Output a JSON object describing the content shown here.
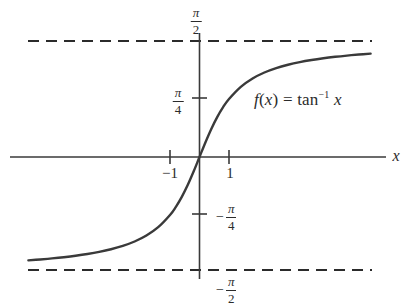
{
  "figure": {
    "title": "",
    "background_color": "#ffffff",
    "curve_color": "#3a3a3a",
    "axis_color": "#3a3a3a",
    "text_color": "#2b2b2b"
  },
  "annotations": {
    "formula_f": "f",
    "formula_open": "(",
    "formula_var": "x",
    "formula_close": ")",
    "formula_equals": "=",
    "formula_tan": "tan",
    "formula_exponent": "−1",
    "formula_arg": "x",
    "formula_plain": "f(x) = tan^-1 x"
  },
  "axes": {
    "x_axis_label": "x",
    "y_axis_label": "",
    "x_ticks": [
      {
        "value": -1,
        "label": "−1"
      },
      {
        "value": 1,
        "label": "1"
      }
    ],
    "y_ticks": [
      {
        "value": 0.7853981634,
        "label": "π/4",
        "numerator": "π",
        "denominator": "4",
        "sign": ""
      },
      {
        "value": -0.7853981634,
        "label": "−π/4",
        "numerator": "π",
        "denominator": "4",
        "sign": "−"
      }
    ],
    "asymptote_labels": [
      {
        "value": 1.5707963268,
        "label": "π/2",
        "numerator": "π",
        "denominator": "2",
        "sign": ""
      },
      {
        "value": -1.5707963268,
        "label": "−π/2",
        "numerator": "π",
        "denominator": "2",
        "sign": "−"
      }
    ]
  },
  "chart_data": {
    "type": "line",
    "title": "",
    "subtitle": "",
    "xlabel": "x",
    "ylabel": "",
    "grid": false,
    "legend": null,
    "xlim": [
      -5.8,
      5.8
    ],
    "ylim": [
      -1.75,
      1.75
    ],
    "x_tick_values": [
      -1,
      1
    ],
    "x_tick_labels": [
      "−1",
      "1"
    ],
    "y_tick_values": [
      0.7853981634,
      -0.7853981634
    ],
    "y_tick_labels": [
      "π/4",
      "−π/4"
    ],
    "series": [
      {
        "name": "f(x) = tan^-1 x",
        "function": "arctan",
        "color": "#3a3a3a",
        "linewidth": 2.4,
        "x": [
          -5.8,
          -5.4,
          -5.0,
          -4.6,
          -4.2,
          -3.8,
          -3.4,
          -3.0,
          -2.6,
          -2.2,
          -1.8,
          -1.4,
          -1.0,
          -0.8,
          -0.6,
          -0.4,
          -0.2,
          0.0,
          0.2,
          0.4,
          0.6,
          0.8,
          1.0,
          1.4,
          1.8,
          2.2,
          2.6,
          3.0,
          3.4,
          3.8,
          4.2,
          4.6,
          5.0,
          5.4,
          5.8
        ],
        "y": [
          -1.3998,
          -1.3876,
          -1.3734,
          -1.3567,
          -1.337,
          -1.3135,
          -1.285,
          -1.249,
          -1.2036,
          -1.1442,
          -1.0637,
          -0.9505,
          -0.7854,
          -0.6747,
          -0.5404,
          -0.3805,
          -0.1974,
          0.0,
          0.1974,
          0.3805,
          0.5404,
          0.6747,
          0.7854,
          0.9505,
          1.0637,
          1.1442,
          1.2036,
          1.249,
          1.285,
          1.3135,
          1.337,
          1.3567,
          1.3734,
          1.3876,
          1.3998
        ]
      }
    ],
    "asymptotes": [
      {
        "orientation": "horizontal",
        "value": 1.5707963268,
        "label": "π/2",
        "style": "dashed",
        "color": "#2b2b2b"
      },
      {
        "orientation": "horizontal",
        "value": -1.5707963268,
        "label": "−π/2",
        "style": "dashed",
        "color": "#2b2b2b"
      }
    ],
    "annotations": [
      {
        "text": "f(x) = tan^-1 x",
        "x": 1.85,
        "y": 0.93
      }
    ]
  }
}
